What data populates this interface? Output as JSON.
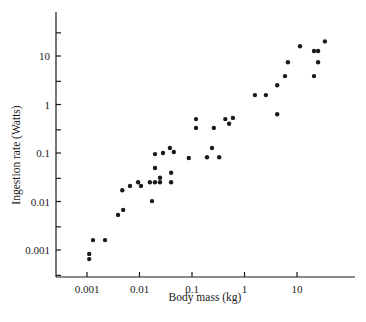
{
  "chart_data": {
    "type": "scatter",
    "title": "",
    "xlabel": "Body mass (kg)",
    "ylabel": "Ingestion rate (Watts)",
    "xscale": "log",
    "yscale": "log",
    "xlim": [
      0.0003,
      60
    ],
    "ylim": [
      0.0003,
      60
    ],
    "grid": false,
    "legend": null,
    "x_ticks": [
      {
        "value": 0.001,
        "label": "0.001"
      },
      {
        "value": 0.01,
        "label": "0.01"
      },
      {
        "value": 0.1,
        "label": "0.1"
      },
      {
        "value": 1,
        "label": "1"
      },
      {
        "value": 10,
        "label": "10"
      }
    ],
    "y_ticks": [
      {
        "value": 0.001,
        "label": "0.001"
      },
      {
        "value": 0.01,
        "label": "0.01"
      },
      {
        "value": 0.1,
        "label": "0.1"
      },
      {
        "value": 1,
        "label": "1"
      },
      {
        "value": 10,
        "label": "10"
      }
    ],
    "y_minor_ticks": [
      0.0003,
      0.003,
      0.03,
      0.3,
      3,
      30
    ],
    "series": [
      {
        "name": "animals",
        "color": "#1a1a1a",
        "points": [
          {
            "x": 0.0011,
            "y": 0.00065
          },
          {
            "x": 0.0011,
            "y": 0.00083
          },
          {
            "x": 0.0013,
            "y": 0.0016
          },
          {
            "x": 0.0022,
            "y": 0.0016
          },
          {
            "x": 0.0039,
            "y": 0.0053
          },
          {
            "x": 0.0049,
            "y": 0.0067
          },
          {
            "x": 0.0047,
            "y": 0.017
          },
          {
            "x": 0.0066,
            "y": 0.021
          },
          {
            "x": 0.0094,
            "y": 0.025
          },
          {
            "x": 0.0107,
            "y": 0.021
          },
          {
            "x": 0.0158,
            "y": 0.025
          },
          {
            "x": 0.0173,
            "y": 0.0102
          },
          {
            "x": 0.0197,
            "y": 0.025
          },
          {
            "x": 0.0197,
            "y": 0.049
          },
          {
            "x": 0.0197,
            "y": 0.095
          },
          {
            "x": 0.0246,
            "y": 0.025
          },
          {
            "x": 0.0246,
            "y": 0.031
          },
          {
            "x": 0.028,
            "y": 0.1
          },
          {
            "x": 0.038,
            "y": 0.127
          },
          {
            "x": 0.04,
            "y": 0.039
          },
          {
            "x": 0.04,
            "y": 0.025
          },
          {
            "x": 0.045,
            "y": 0.105
          },
          {
            "x": 0.087,
            "y": 0.079
          },
          {
            "x": 0.119,
            "y": 0.5
          },
          {
            "x": 0.119,
            "y": 0.33
          },
          {
            "x": 0.193,
            "y": 0.082
          },
          {
            "x": 0.24,
            "y": 0.127
          },
          {
            "x": 0.26,
            "y": 0.33
          },
          {
            "x": 0.33,
            "y": 0.082
          },
          {
            "x": 0.43,
            "y": 0.5
          },
          {
            "x": 0.51,
            "y": 0.4
          },
          {
            "x": 0.6,
            "y": 0.53
          },
          {
            "x": 1.58,
            "y": 1.56
          },
          {
            "x": 2.56,
            "y": 1.56
          },
          {
            "x": 4.2,
            "y": 0.63
          },
          {
            "x": 4.2,
            "y": 2.5
          },
          {
            "x": 5.9,
            "y": 3.85
          },
          {
            "x": 6.7,
            "y": 7.4
          },
          {
            "x": 11.4,
            "y": 15.9
          },
          {
            "x": 21.1,
            "y": 12.7
          },
          {
            "x": 25.2,
            "y": 12.7
          },
          {
            "x": 25.2,
            "y": 7.4
          },
          {
            "x": 21.1,
            "y": 3.85
          },
          {
            "x": 34,
            "y": 20
          }
        ]
      }
    ]
  },
  "layout": {
    "x_axis": {
      "x_start": 56,
      "x_end": 355,
      "y": 277,
      "px_per_decade": 52.5,
      "origin_px": 87,
      "origin_log": -3
    },
    "y_axis": {
      "x": 56,
      "y_start": 12,
      "y_end": 277,
      "px_per_decade": 48.5,
      "origin_px": 250,
      "origin_log": -3
    }
  }
}
